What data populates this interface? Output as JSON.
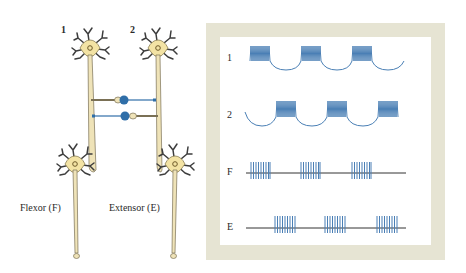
{
  "neurons": {
    "interneuron_1_label": "1",
    "interneuron_2_label": "2",
    "flexor_label": "Flexor (F)",
    "extensor_label": "Extensor (E)"
  },
  "traces": {
    "rows": [
      {
        "label": "1",
        "kind": "membrane-potential",
        "bursts_at": [
          0,
          1,
          2
        ]
      },
      {
        "label": "2",
        "kind": "membrane-potential",
        "bursts_at": [
          0.5,
          1.5,
          2.5
        ]
      },
      {
        "label": "F",
        "kind": "spike-train",
        "bursts_at": [
          0,
          1,
          2
        ]
      },
      {
        "label": "E",
        "kind": "spike-train",
        "bursts_at": [
          0.5,
          1.5,
          2.5
        ]
      }
    ]
  },
  "colors": {
    "cell_body": "#f3e3a4",
    "axon": "#efe3b8",
    "outline": "#5a5a4a",
    "dendrite": "#3d3d3d",
    "inhibitory": "#2f6ea8",
    "trace": "#4a7fb5",
    "frame": "#e6e4d3"
  }
}
